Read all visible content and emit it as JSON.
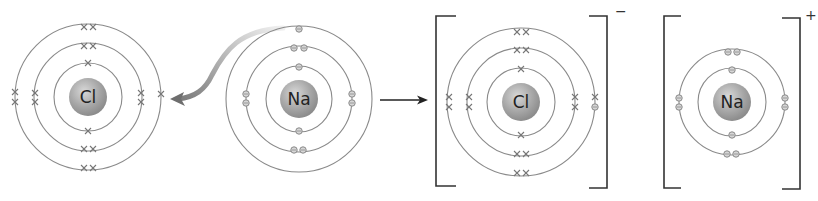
{
  "diagram": {
    "colors": {
      "shell": "#8a8a8a",
      "nucleus": "#9a9a9a",
      "bracket": "#333333",
      "transfer_arrow": "#888888"
    },
    "atoms": [
      {
        "id": "cl-atom",
        "symbol": "Cl",
        "electron_marker": "cross",
        "shells": [
          2,
          8,
          7
        ]
      },
      {
        "id": "na-atom",
        "symbol": "Na",
        "electron_marker": "circle",
        "shells": [
          2,
          8,
          1
        ]
      }
    ],
    "ions": [
      {
        "id": "cl-ion",
        "symbol": "Cl",
        "charge": "−",
        "shells": [
          2,
          8,
          8
        ],
        "note": "one outer electron shown as circle (gained from Na)"
      },
      {
        "id": "na-ion",
        "symbol": "Na",
        "charge": "+",
        "shells": [
          2,
          8
        ]
      }
    ],
    "arrows": [
      {
        "id": "electron-transfer-arrow",
        "from": "na-atom outer electron",
        "to": "cl-atom outer shell",
        "style": "curved"
      },
      {
        "id": "reaction-arrow",
        "from": "atoms",
        "to": "ions",
        "style": "straight"
      }
    ]
  }
}
